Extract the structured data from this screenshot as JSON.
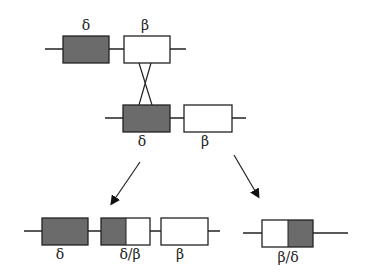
{
  "diagram": {
    "colors": {
      "dark_gene": "#6b6b6b",
      "light_gene": "#ffffff",
      "stroke": "#222222"
    },
    "rows": {
      "top": {
        "gene_labels": [
          "δ",
          "β"
        ]
      },
      "middle": {
        "gene_labels": [
          "δ",
          "β"
        ]
      },
      "bottom_left": {
        "gene_labels": [
          "δ",
          "δ/β",
          "β"
        ]
      },
      "bottom_right": {
        "gene_labels": [
          "β/δ"
        ]
      }
    },
    "arrows": [
      "left-product-arrow",
      "right-product-arrow"
    ]
  }
}
